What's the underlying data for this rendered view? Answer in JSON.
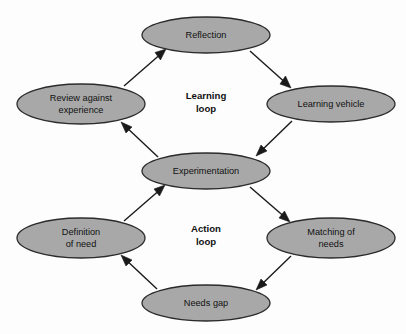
{
  "diagram": {
    "background_color": "#fdfdfd",
    "node_fill_color": "#a8a8a8",
    "node_stroke_color": "#2b2b2b",
    "arrow_color": "#1a1a1a",
    "text_color": "#111111",
    "nodes": [
      {
        "id": "reflection",
        "label": "Reflection",
        "lines": [
          "Reflection"
        ],
        "cx": 206,
        "cy": 35,
        "rx": 64,
        "ry": 18,
        "loop": "learning"
      },
      {
        "id": "learning-vehicle",
        "label": "Learning vehicle",
        "lines": [
          "Learning vehicle"
        ],
        "cx": 331,
        "cy": 104,
        "rx": 64,
        "ry": 18,
        "loop": "learning"
      },
      {
        "id": "review-against-experience",
        "label": "Review against experience",
        "lines": [
          "Review against",
          "experience"
        ],
        "cx": 81,
        "cy": 104,
        "rx": 64,
        "ry": 20,
        "loop": "learning"
      },
      {
        "id": "experimentation",
        "label": "Experimentation",
        "lines": [
          "Experimentation"
        ],
        "cx": 206,
        "cy": 171,
        "rx": 64,
        "ry": 18,
        "loop": "both"
      },
      {
        "id": "definition-of-need",
        "label": "Definition of need",
        "lines": [
          "Definition",
          "of need"
        ],
        "cx": 81,
        "cy": 238,
        "rx": 64,
        "ry": 20,
        "loop": "action"
      },
      {
        "id": "matching-of-needs",
        "label": "Matching of needs",
        "lines": [
          "Matching of",
          "needs"
        ],
        "cx": 331,
        "cy": 238,
        "rx": 64,
        "ry": 20,
        "loop": "action"
      },
      {
        "id": "needs-gap",
        "label": "Needs gap",
        "lines": [
          "Needs gap"
        ],
        "cx": 206,
        "cy": 303,
        "rx": 64,
        "ry": 18,
        "loop": "action"
      }
    ],
    "loop_labels": [
      {
        "id": "learning-loop",
        "lines": [
          "Learning",
          "loop"
        ],
        "cx": 206,
        "cy": 102
      },
      {
        "id": "action-loop",
        "lines": [
          "Action",
          "loop"
        ],
        "cx": 206,
        "cy": 235
      }
    ],
    "edges": [
      {
        "id": "review-to-reflection",
        "from": "review-against-experience",
        "to": "reflection",
        "direction": "up-right",
        "x1": 124,
        "y1": 86,
        "x2": 161,
        "y2": 51
      },
      {
        "id": "reflection-to-learning-vehicle",
        "from": "reflection",
        "to": "learning-vehicle",
        "direction": "down-right",
        "x1": 252,
        "y1": 51,
        "x2": 290,
        "y2": 87
      },
      {
        "id": "learning-vehicle-to-experimentation",
        "from": "learning-vehicle",
        "to": "experimentation",
        "direction": "down-left",
        "x1": 292,
        "y1": 121,
        "x2": 256,
        "y2": 156
      },
      {
        "id": "experimentation-to-review",
        "from": "experimentation",
        "to": "review-against-experience",
        "direction": "up-left",
        "x1": 158,
        "y1": 157,
        "x2": 121,
        "y2": 123
      },
      {
        "id": "definition-to-experimentation",
        "from": "definition-of-need",
        "to": "experimentation",
        "direction": "up-right",
        "x1": 124,
        "y1": 221,
        "x2": 160,
        "y2": 187
      },
      {
        "id": "experimentation-to-matching",
        "from": "experimentation",
        "to": "matching-of-needs",
        "direction": "down-right",
        "x1": 252,
        "y1": 187,
        "x2": 289,
        "y2": 221
      },
      {
        "id": "matching-to-needs-gap",
        "from": "matching-of-needs",
        "to": "needs-gap",
        "direction": "down-left",
        "x1": 291,
        "y1": 256,
        "x2": 256,
        "y2": 289
      },
      {
        "id": "needs-gap-to-definition",
        "from": "needs-gap",
        "to": "definition-of-need",
        "direction": "up-left",
        "x1": 157,
        "y1": 289,
        "x2": 121,
        "y2": 256
      }
    ]
  }
}
